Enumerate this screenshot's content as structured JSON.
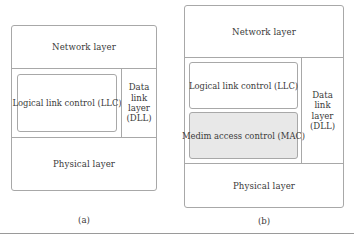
{
  "figure": {
    "panels": [
      {
        "id": "a",
        "caption": "(a)",
        "bands": [
          {
            "name": "network",
            "label": "Network layer"
          },
          {
            "name": "data-link",
            "column_label_lines": [
              "Data",
              "link",
              "layer",
              "(DLL)"
            ],
            "sublayers": [
              {
                "name": "llc",
                "label": "Logical link control (LLC)",
                "fill": "#ffffff"
              }
            ]
          },
          {
            "name": "physical",
            "label": "Physical layer"
          }
        ]
      },
      {
        "id": "b",
        "caption": "(b)",
        "bands": [
          {
            "name": "network",
            "label": "Network layer"
          },
          {
            "name": "data-link",
            "column_label_lines": [
              "Data",
              "link",
              "layer",
              "(DLL)"
            ],
            "sublayers": [
              {
                "name": "llc",
                "label": "Logical link control (LLC)",
                "fill": "#ffffff"
              },
              {
                "name": "mac",
                "label": "Medim access control (MAC)",
                "fill": "#e8e8e8"
              }
            ]
          },
          {
            "name": "physical",
            "label": "Physical layer"
          }
        ]
      }
    ],
    "colors": {
      "stroke": "#a8a8a8",
      "text": "#3a3a3a",
      "shaded_fill": "#e8e8e8",
      "page_background": "#ffffff",
      "rule": "#9a9a9a"
    }
  }
}
